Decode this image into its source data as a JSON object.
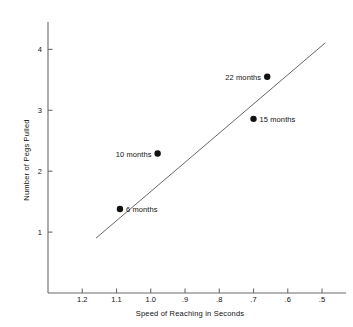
{
  "chart_data": {
    "type": "scatter",
    "title": "",
    "xlabel": "Speed of Reaching in Seconds",
    "ylabel": "Number of Pegs Pulled",
    "x_ticks": [
      "1.2",
      "1.1",
      "1.0",
      ".9",
      ".8",
      ".7",
      ".6",
      ".5"
    ],
    "x_tick_values": [
      1.2,
      1.1,
      1.0,
      0.9,
      0.8,
      0.7,
      0.6,
      0.5
    ],
    "y_ticks": [
      "1",
      "2",
      "3",
      "4"
    ],
    "y_tick_values": [
      1,
      2,
      3,
      4
    ],
    "xlim": [
      1.3,
      0.43
    ],
    "ylim": [
      0,
      4.45
    ],
    "x_axis_reversed": true,
    "grid": false,
    "legend": null,
    "points": [
      {
        "label": "6 months",
        "x": 1.09,
        "y": 1.38,
        "label_side": "right"
      },
      {
        "label": "10 months",
        "x": 0.98,
        "y": 2.29,
        "label_side": "left"
      },
      {
        "label": "15 months",
        "x": 0.7,
        "y": 2.86,
        "label_side": "right"
      },
      {
        "label": "22 months",
        "x": 0.66,
        "y": 3.55,
        "label_side": "left"
      }
    ],
    "trend_line": {
      "x_start": 1.16,
      "y_start": 0.9,
      "x_end": 0.49,
      "y_end": 4.11
    },
    "colors": {
      "axis": "#6b6b6b",
      "marker": "#111111",
      "line": "#555555",
      "text": "#111111",
      "background": "#ffffff"
    }
  }
}
